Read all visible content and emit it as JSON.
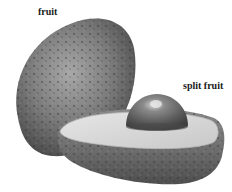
{
  "illustration": {
    "subject": "avocado",
    "labels": {
      "fruit": "fruit",
      "split_fruit": "split fruit"
    },
    "colors": {
      "background": "#ffffff",
      "skin_dark": "#4a4a4a",
      "skin_mid": "#7a7a7a",
      "skin_light": "#a8a8a8",
      "flesh": "#dcdcdc",
      "flesh_edge": "#c4c4c4",
      "pit_dark": "#3e3e3e",
      "pit_mid": "#6e6e6e",
      "pit_highlight": "#d8d8d8",
      "label_text": "#1a1a1a"
    }
  }
}
